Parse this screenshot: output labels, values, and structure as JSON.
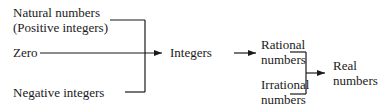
{
  "diagram": {
    "type": "number-classification-tree",
    "nodes": {
      "natural_line1": "Natural numbers",
      "natural_line2": "(Positive integers)",
      "zero": "Zero",
      "negative": "Negative integers",
      "integers": "Integers",
      "rational_line1": "Rational",
      "rational_line2": "numbers",
      "irrational_line1": "Irrational",
      "irrational_line2": "numbers",
      "real_line1": "Real",
      "real_line2": "numbers"
    },
    "edges": [
      {
        "from": [
          "Natural numbers (Positive integers)",
          "Zero",
          "Negative integers"
        ],
        "to": "Integers"
      },
      {
        "from": [
          "Integers"
        ],
        "to": "Rational numbers"
      },
      {
        "from": [
          "Rational numbers",
          "Irrational numbers"
        ],
        "to": "Real numbers"
      }
    ],
    "line_color": "#1a1a1a"
  }
}
